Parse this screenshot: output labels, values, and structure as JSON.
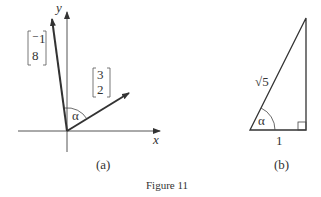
{
  "figure": {
    "caption": "Figure 11",
    "panel_a": {
      "label": "(a)",
      "x_axis_label": "x",
      "y_axis_label": "y",
      "vector_1": {
        "top": "⁻1",
        "bottom": "8"
      },
      "vector_2": {
        "top": "3",
        "bottom": "2"
      },
      "angle_label": "α"
    },
    "panel_b": {
      "label": "(b)",
      "hypotenuse_label": "√5",
      "base_label": "1",
      "angle_label": "α"
    }
  }
}
